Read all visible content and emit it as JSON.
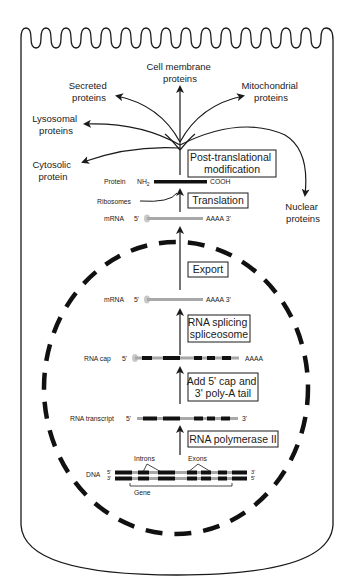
{
  "diagram": {
    "destinations": {
      "cell_membrane": [
        "Cell membrane",
        "proteins"
      ],
      "secreted": [
        "Secreted",
        "proteins"
      ],
      "mitochondrial": [
        "Mitochondrial",
        "proteins"
      ],
      "lysosomal": [
        "Lysosomal",
        "proteins"
      ],
      "cytosolic": [
        "Cytosolic",
        "protein"
      ],
      "nuclear": [
        "Nuclear",
        "proteins"
      ]
    },
    "steps": {
      "post_translational": [
        "Post-translational",
        "modification"
      ],
      "translation": "Translation",
      "export": "Export",
      "rna_splicing": [
        "RNA splicing",
        "spliceosome"
      ],
      "cap_tail": [
        "Add 5' cap and",
        "3' poly-A tail"
      ],
      "polymerase": "RNA polymerase II"
    },
    "molecules": {
      "protein": {
        "label": "Protein",
        "n_term": "NH",
        "n_sub": "2",
        "c_term": "COOH"
      },
      "ribosomes": "Ribosomes",
      "mrna_cyto": {
        "label": "mRNA",
        "five": "5'",
        "tail": "AAAA 3'"
      },
      "mrna_nuc": {
        "label": "mRNA",
        "five": "5'",
        "tail": "AAAA 3'"
      },
      "rna_cap": {
        "label": "RNA cap",
        "five": "5'",
        "tail": "AAAA"
      },
      "rna_transcript": {
        "label": "RNA transcript",
        "five": "5'",
        "three": "3'"
      },
      "dna": {
        "label": "DNA",
        "top_left": "5'",
        "bottom_left": "3'",
        "top_right": "3'",
        "bottom_right": "5'",
        "introns": "Introns",
        "exons": "Exons",
        "gene": "Gene"
      }
    },
    "colors": {
      "line": "#1a1a1a",
      "rna_gray": "#a8a8a8",
      "cap_gray": "#c8c8c8",
      "background": "#ffffff"
    }
  }
}
